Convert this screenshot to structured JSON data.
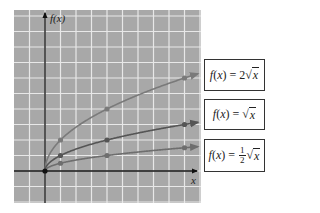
{
  "chart_data": {
    "type": "line",
    "title": "",
    "xlabel": "x",
    "ylabel": "f(x)",
    "xlim": [
      -2,
      10
    ],
    "ylim": [
      -2,
      10
    ],
    "grid": true,
    "legend_position": "right",
    "x_sample_points": [
      0,
      1,
      4,
      9
    ],
    "series": [
      {
        "name": "f(x) = 2√x",
        "x": [
          0,
          1,
          4,
          9
        ],
        "values": [
          0,
          2,
          4,
          6
        ],
        "color": "#7a7a7a"
      },
      {
        "name": "f(x) = √x",
        "x": [
          0,
          1,
          4,
          9
        ],
        "values": [
          0,
          1,
          2,
          3
        ],
        "color": "#555555"
      },
      {
        "name": "f(x) = ½√x",
        "x": [
          0,
          1,
          4,
          9
        ],
        "values": [
          0,
          0.5,
          1,
          1.5
        ],
        "color": "#6e6e6e"
      }
    ]
  },
  "axes": {
    "x_label": "x",
    "y_label": "f(x)"
  },
  "legend": {
    "items": [
      {
        "prefix": "f(x) = 2",
        "radicand": "x"
      },
      {
        "prefix": "f(x) = ",
        "radicand": "x"
      },
      {
        "prefix": "f(x) = ",
        "frac_num": "1",
        "frac_den": "2",
        "radicand": "x"
      }
    ]
  },
  "colors": {
    "grid_bg": "#a8a8a8",
    "grid_line": "#e8e8e8",
    "axis": "#111111"
  }
}
